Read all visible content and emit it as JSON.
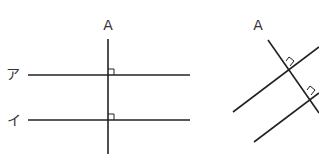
{
  "colors": {
    "line": "#222222",
    "label": "#333333",
    "background": "#ffffff"
  },
  "left_figure": {
    "transversal_label": "A",
    "line_labels": [
      "ア",
      "イ"
    ],
    "right_angle_marks": 2,
    "description": "Vertical line A perpendicular to two horizontal parallel lines ア and イ"
  },
  "right_figure": {
    "transversal_label": "A",
    "right_angle_marks": 2,
    "description": "Slanted line A perpendicular to two slanted parallel lines"
  }
}
